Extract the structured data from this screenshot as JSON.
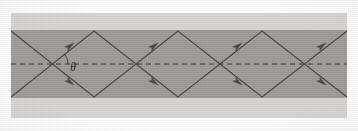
{
  "figure": {
    "kind": "waveguide-ray-diagram",
    "caption": "",
    "title": ""
  },
  "labels": {
    "angle": "θ"
  },
  "colors": {
    "page_background": "#ffffff",
    "cladding": "#d7d6d4",
    "core": "#9d9c9a",
    "ray_stroke": "#4a4846",
    "axis_stroke": "#3a3836",
    "label_color": "#1f1e1d",
    "arrow_fill": "#36343200"
  },
  "geometry": {
    "image_width": 358,
    "image_height": 131,
    "cladding_rect": {
      "x": 11,
      "y": 13,
      "width": 336,
      "height": 105
    },
    "core_rect": {
      "x": 11,
      "y": 30,
      "width": 336,
      "height": 68
    },
    "axis_y": 64,
    "axis_x_start": 11,
    "axis_x_end": 347,
    "axis_dash": "5 4",
    "ray_top_y": 31,
    "ray_bottom_y": 97,
    "half_period": 42,
    "crossings_x": [
      52,
      136,
      220,
      304
    ],
    "top_vertices_x": [
      94,
      178,
      262,
      346
    ],
    "bottom_vertices_x": [
      94,
      178,
      262,
      346
    ],
    "ray_entry_left_x": 11,
    "angle_arc_center": {
      "x": 52,
      "y": 64
    },
    "angle_arc_radius": 16,
    "angle_label_pos": {
      "x": 73,
      "y": 71
    }
  },
  "chart_data": {
    "type": "line",
    "title": "",
    "xlabel": "",
    "ylabel": "",
    "grid": false,
    "legend": "none",
    "xlim": [
      11,
      347
    ],
    "ylim": [
      13,
      118
    ],
    "annotations": [
      {
        "text": "θ",
        "x": 73,
        "y": 71,
        "description": "angle between ray and optical axis"
      }
    ],
    "series": [
      {
        "name": "zigzag-ray-up",
        "comment": "ray entering lower-left, bouncing up-right",
        "points": [
          {
            "x": 11,
            "y": 97
          },
          {
            "x": 94,
            "y": 31
          },
          {
            "x": 178,
            "y": 97
          },
          {
            "x": 262,
            "y": 31
          },
          {
            "x": 347,
            "y": 97
          }
        ]
      },
      {
        "name": "zigzag-ray-down",
        "comment": "ray entering upper-left, bouncing down-right",
        "points": [
          {
            "x": 11,
            "y": 31
          },
          {
            "x": 94,
            "y": 97
          },
          {
            "x": 178,
            "y": 31
          },
          {
            "x": 262,
            "y": 97
          },
          {
            "x": 347,
            "y": 31
          }
        ]
      },
      {
        "name": "optical-axis",
        "comment": "dashed horizontal centre line",
        "points": [
          {
            "x": 11,
            "y": 64
          },
          {
            "x": 347,
            "y": 64
          }
        ]
      }
    ],
    "arrow_markers": [
      {
        "x": 70,
        "y": 46,
        "angle_deg": -38,
        "on": "zigzag-ray-up"
      },
      {
        "x": 70,
        "y": 82,
        "angle_deg": 38,
        "on": "zigzag-ray-down"
      },
      {
        "x": 154,
        "y": 46,
        "angle_deg": -38,
        "on": "zigzag-ray-up"
      },
      {
        "x": 154,
        "y": 82,
        "angle_deg": 38,
        "on": "zigzag-ray-down"
      },
      {
        "x": 238,
        "y": 46,
        "angle_deg": -38,
        "on": "zigzag-ray-up"
      },
      {
        "x": 238,
        "y": 82,
        "angle_deg": 38,
        "on": "zigzag-ray-down"
      },
      {
        "x": 322,
        "y": 46,
        "angle_deg": -38,
        "on": "zigzag-ray-up"
      },
      {
        "x": 322,
        "y": 82,
        "angle_deg": 38,
        "on": "zigzag-ray-down"
      }
    ]
  }
}
